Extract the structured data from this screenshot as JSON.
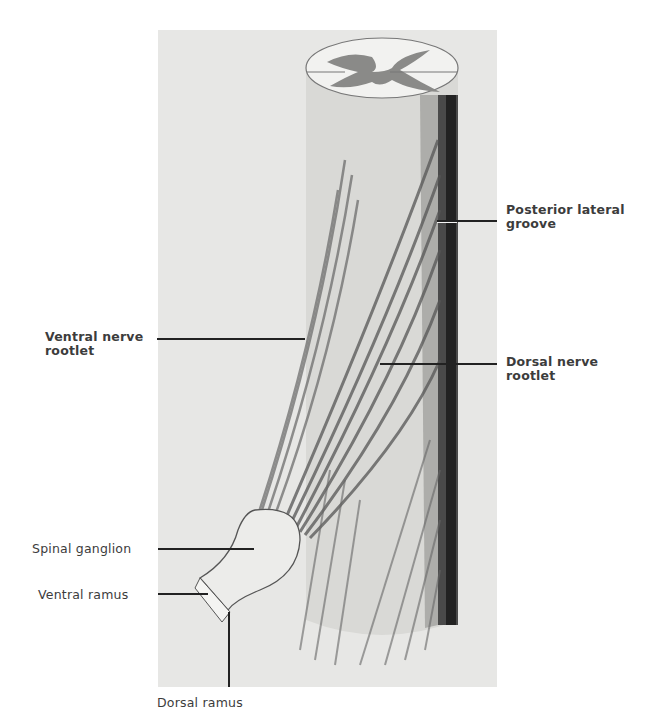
{
  "figure": {
    "colors": {
      "plate_background": "#e7e7e5",
      "cord_shade": "#cfcfcc",
      "grey_matter": "#8a8a88",
      "dark_groove": "#2a2a2a",
      "label_text": "#3c3c3c",
      "leader_line": "#222222"
    }
  },
  "labels": {
    "posterior_lateral_groove": {
      "line1": "Posterior lateral",
      "line2": "groove",
      "weight": "bold"
    },
    "ventral_nerve_rootlet": {
      "line1": "Ventral nerve",
      "line2": "rootlet",
      "weight": "bold"
    },
    "dorsal_nerve_rootlet": {
      "line1": "Dorsal nerve",
      "line2": "rootlet",
      "weight": "bold"
    },
    "spinal_ganglion": {
      "text": "Spinal ganglion",
      "weight": "normal"
    },
    "ventral_ramus": {
      "text": "Ventral ramus",
      "weight": "normal"
    },
    "dorsal_ramus": {
      "text": "Dorsal ramus",
      "weight": "normal"
    }
  }
}
